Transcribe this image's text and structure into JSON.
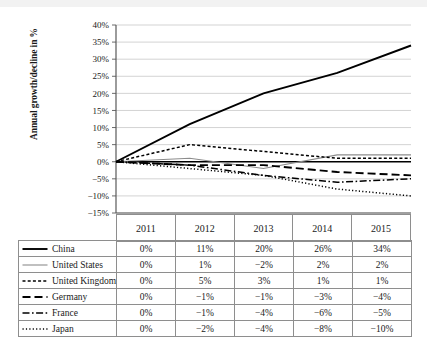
{
  "chart_data": {
    "type": "line",
    "title": "",
    "xlabel": "",
    "ylabel": "Annual growth/decline in %",
    "categories": [
      "2011",
      "2012",
      "2013",
      "2014",
      "2015"
    ],
    "ylim": [
      -15,
      40
    ],
    "ytick_labels": [
      "40%",
      "35%",
      "30%",
      "25%",
      "20%",
      "15%",
      "10%",
      "5%",
      "0%",
      "−5%",
      "−10%",
      "−15%"
    ],
    "ytick_values": [
      40,
      35,
      30,
      25,
      20,
      15,
      10,
      5,
      0,
      -5,
      -10,
      -15
    ],
    "grid": true,
    "legend_position": "table-below",
    "series": [
      {
        "name": "China",
        "style": "solid-thick",
        "color": "#000000",
        "values": [
          0,
          11,
          20,
          26,
          34
        ],
        "labels": [
          "0%",
          "11%",
          "20%",
          "26%",
          "34%"
        ]
      },
      {
        "name": "United States",
        "style": "solid-thin",
        "color": "#8c8c8c",
        "values": [
          0,
          1,
          -2,
          2,
          2
        ],
        "labels": [
          "0%",
          "1%",
          "−2%",
          "2%",
          "2%"
        ]
      },
      {
        "name": "United Kingdom",
        "style": "dashed",
        "color": "#000000",
        "values": [
          0,
          5,
          3,
          1,
          1
        ],
        "labels": [
          "0%",
          "5%",
          "3%",
          "1%",
          "1%"
        ]
      },
      {
        "name": "Germany",
        "style": "long-dash",
        "color": "#000000",
        "values": [
          0,
          -1,
          -1,
          -3,
          -4
        ],
        "labels": [
          "0%",
          "−1%",
          "−1%",
          "−3%",
          "−4%"
        ]
      },
      {
        "name": "France",
        "style": "dash-dot",
        "color": "#000000",
        "values": [
          0,
          -1,
          -4,
          -6,
          -5
        ],
        "labels": [
          "0%",
          "−1%",
          "−4%",
          "−6%",
          "−5%"
        ]
      },
      {
        "name": "Japan",
        "style": "dotted",
        "color": "#000000",
        "values": [
          0,
          -2,
          -4,
          -8,
          -10
        ],
        "labels": [
          "0%",
          "−2%",
          "−4%",
          "−8%",
          "−10%"
        ]
      }
    ]
  },
  "table": {
    "year_headers": [
      "2011",
      "2012",
      "2013",
      "2014",
      "2015"
    ]
  },
  "colors": {
    "gridline": "#c8c8c8",
    "axis": "#595959",
    "zero_line": "#000000",
    "table_border": "#8e8e8e",
    "us_line": "#8c8c8c"
  }
}
